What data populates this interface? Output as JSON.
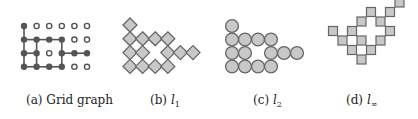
{
  "figure": {
    "grid": {
      "rows": 4,
      "cols": 6,
      "occupied": [
        [
          1,
          0,
          0,
          0,
          0,
          0
        ],
        [
          1,
          1,
          1,
          1,
          0,
          0
        ],
        [
          1,
          1,
          0,
          1,
          1,
          1
        ],
        [
          1,
          1,
          1,
          1,
          0,
          0
        ]
      ],
      "edges": [
        [
          [
            0,
            0
          ],
          [
            1,
            0
          ]
        ],
        [
          [
            1,
            0
          ],
          [
            2,
            0
          ]
        ],
        [
          [
            2,
            0
          ],
          [
            3,
            0
          ]
        ],
        [
          [
            1,
            0
          ],
          [
            1,
            1
          ]
        ],
        [
          [
            1,
            1
          ],
          [
            1,
            2
          ]
        ],
        [
          [
            1,
            2
          ],
          [
            1,
            3
          ]
        ],
        [
          [
            2,
            0
          ],
          [
            2,
            1
          ]
        ],
        [
          [
            2,
            3
          ],
          [
            2,
            4
          ]
        ],
        [
          [
            2,
            4
          ],
          [
            2,
            5
          ]
        ],
        [
          [
            3,
            0
          ],
          [
            3,
            1
          ]
        ],
        [
          [
            3,
            1
          ],
          [
            3,
            2
          ]
        ],
        [
          [
            3,
            2
          ],
          [
            3,
            3
          ]
        ],
        [
          [
            1,
            1
          ],
          [
            2,
            1
          ]
        ],
        [
          [
            2,
            1
          ],
          [
            3,
            1
          ]
        ],
        [
          [
            1,
            3
          ],
          [
            2,
            3
          ]
        ],
        [
          [
            2,
            3
          ],
          [
            3,
            3
          ]
        ]
      ]
    },
    "colors": {
      "node_fill": "#555555",
      "hollow_stroke": "#555555",
      "shape_fill": "#c8c8c8",
      "shape_stroke": "#666666",
      "edge": "#555555"
    },
    "subfigures": [
      {
        "id": "a",
        "letter": "(a)",
        "label": "Grid graph",
        "sub": "",
        "kind": "grid"
      },
      {
        "id": "b",
        "letter": "(b)",
        "label": "l",
        "sub": "1",
        "kind": "l1"
      },
      {
        "id": "c",
        "letter": "(c)",
        "label": "l",
        "sub": "2",
        "kind": "l2"
      },
      {
        "id": "d",
        "letter": "(d)",
        "label": "l",
        "sub": "∞",
        "kind": "linf"
      }
    ]
  }
}
